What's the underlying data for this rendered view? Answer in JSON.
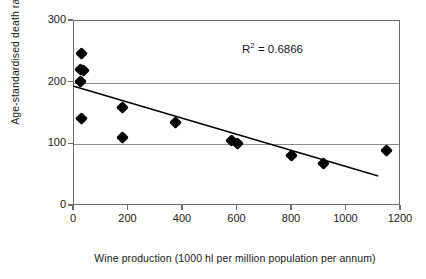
{
  "chart_data": {
    "type": "scatter",
    "title": "",
    "xlabel": "Wine production (1000 hl per million population per annum)",
    "ylabel": "Age-standardised death rate from CHD",
    "xlim": [
      0,
      1200
    ],
    "ylim": [
      0,
      300
    ],
    "xticks": [
      0,
      200,
      400,
      600,
      800,
      1000,
      1200
    ],
    "yticks": [
      0,
      100,
      200,
      300
    ],
    "xtick_labels": [
      "0",
      "200",
      "400",
      "600",
      "800",
      "1000",
      "1200"
    ],
    "ytick_labels": [
      "0",
      "100",
      "200",
      "300"
    ],
    "grid": "horizontal",
    "legend": "none",
    "marker": "filled-diamond",
    "marker_color": "#000000",
    "points": [
      {
        "x": 30,
        "y": 245
      },
      {
        "x": 28,
        "y": 220
      },
      {
        "x": 40,
        "y": 218
      },
      {
        "x": 27,
        "y": 200
      },
      {
        "x": 33,
        "y": 140
      },
      {
        "x": 180,
        "y": 158
      },
      {
        "x": 180,
        "y": 110
      },
      {
        "x": 375,
        "y": 133
      },
      {
        "x": 580,
        "y": 105
      },
      {
        "x": 605,
        "y": 100
      },
      {
        "x": 800,
        "y": 80
      },
      {
        "x": 920,
        "y": 68
      },
      {
        "x": 1150,
        "y": 88
      }
    ],
    "trendline": {
      "type": "linear",
      "x_start": 0,
      "y_start": 193,
      "x_end": 1120,
      "y_end": 47,
      "color": "#000000"
    },
    "annotations": [
      {
        "name": "r-squared",
        "text_prefix": "R",
        "text_sup": "2",
        "text_suffix": "= 0.6866",
        "value": 0.6866,
        "x": 620,
        "y": 255
      }
    ]
  },
  "colors": {
    "axis": "#6d6d6d",
    "grid": "#8c8c8c",
    "marker": "#000000",
    "text": "#1a1a1a",
    "background": "#ffffff"
  }
}
